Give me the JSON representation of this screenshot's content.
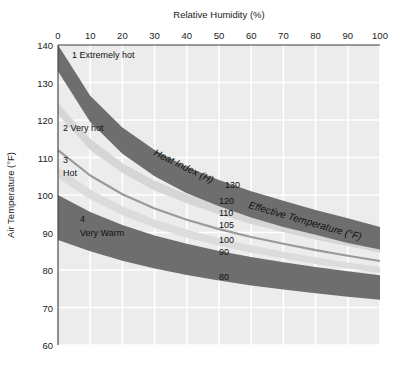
{
  "chart_data": {
    "type": "line",
    "title": "",
    "xlabel": "Relative Humidity (%)",
    "ylabel": "Air Temperature (°F)",
    "xlim": [
      0,
      100
    ],
    "ylim": [
      60,
      140
    ],
    "xticks": [
      "0",
      "10",
      "20",
      "30",
      "40",
      "50",
      "60",
      "70",
      "80",
      "90",
      "100"
    ],
    "yticks": [
      "140",
      "130",
      "120",
      "110",
      "100",
      "90",
      "80",
      "70",
      "60"
    ],
    "grid": true,
    "legend_position": "none",
    "annotations": {
      "heat_index": "Heat Index (H)",
      "effective_temperature": "Effective Temperature (°F)"
    },
    "x": [
      0,
      10,
      20,
      30,
      40,
      50,
      60,
      70,
      80,
      90,
      100
    ],
    "series": [
      {
        "name": "130",
        "label": "130",
        "style": "dark-band",
        "color": "#6e6e6e",
        "upper": [
          140.0,
          126.5,
          118.0,
          112.0,
          107.5,
          104.0,
          101.0,
          98.5,
          96.0,
          93.8,
          91.5
        ],
        "values": [
          136.5,
          123.0,
          114.5,
          108.5,
          104.0,
          100.5,
          97.5,
          95.0,
          92.7,
          90.5,
          88.5
        ],
        "lower": [
          133.0,
          119.5,
          111.0,
          105.0,
          100.5,
          97.0,
          94.0,
          91.5,
          89.4,
          87.2,
          85.5
        ]
      },
      {
        "name": "120",
        "label": "120",
        "style": "light-band",
        "color": "#d6d6d6",
        "upper": [
          124.5,
          115.0,
          108.5,
          103.8,
          100.2,
          97.2,
          94.7,
          92.5,
          90.5,
          88.6,
          86.8
        ],
        "values": [
          123.0,
          113.5,
          107.2,
          102.5,
          99.0,
          96.0,
          93.5,
          91.3,
          89.3,
          87.5,
          85.7
        ],
        "lower": [
          121.5,
          112.0,
          105.9,
          101.2,
          97.8,
          94.8,
          92.3,
          90.1,
          88.1,
          86.4,
          84.6
        ]
      },
      {
        "name": "110",
        "label": "110",
        "style": "mid-line",
        "color": "#9a9a9a",
        "values": [
          112.0,
          105.2,
          100.2,
          96.4,
          93.4,
          90.9,
          88.8,
          87.0,
          85.3,
          83.8,
          82.4
        ]
      },
      {
        "name": "105",
        "label": "105",
        "style": "light-band",
        "color": "#dcdcdc",
        "upper": [
          107.5,
          101.5,
          97.0,
          93.5,
          90.8,
          88.5,
          86.6,
          84.9,
          83.4,
          82.0,
          80.8
        ],
        "values": [
          106.0,
          100.2,
          95.8,
          92.4,
          89.7,
          87.5,
          85.6,
          84.0,
          82.5,
          81.2,
          80.0
        ],
        "lower": [
          104.5,
          98.9,
          94.6,
          91.3,
          88.6,
          86.5,
          84.6,
          83.1,
          81.6,
          80.4,
          79.2
        ]
      },
      {
        "name": "100",
        "label": "100",
        "style": "dark-band",
        "color": "#6e6e6e",
        "upper": [
          100.0,
          95.5,
          92.0,
          89.2,
          87.0,
          85.1,
          83.5,
          82.1,
          80.8,
          79.7,
          78.6
        ],
        "values": [
          94.0,
          90.2,
          87.2,
          84.8,
          82.8,
          81.1,
          79.7,
          78.4,
          77.3,
          76.3,
          75.4
        ],
        "lower": [
          88.0,
          85.0,
          82.5,
          80.4,
          78.7,
          77.2,
          75.9,
          74.8,
          73.8,
          72.9,
          72.1
        ]
      },
      {
        "name": "90",
        "label": "90",
        "style": "label-only",
        "color": "#6e6e6e",
        "values": [
          91.0,
          87.2,
          84.3,
          82.0,
          80.1,
          78.5,
          77.1,
          75.9,
          74.9,
          74.0,
          73.2
        ]
      },
      {
        "name": "80",
        "label": "80",
        "style": "label-only",
        "color": "#6e6e6e",
        "values": [
          85.0,
          81.5,
          78.8,
          76.7,
          75.0,
          73.5,
          72.3,
          71.2,
          70.3,
          69.5,
          68.8
        ]
      }
    ],
    "zones": [
      {
        "id": "1",
        "number": "1",
        "label": "Extremely hot",
        "text": "1 Extremely hot"
      },
      {
        "id": "2",
        "number": "2",
        "label": "Very hot",
        "text": "2 Very hot"
      },
      {
        "id": "3",
        "number": "3",
        "label": "Hot",
        "text": "3"
      },
      {
        "id": "3b",
        "number": "",
        "label": "Hot",
        "text": "Hot"
      },
      {
        "id": "4",
        "number": "4",
        "label": "Very Warm",
        "text": "4"
      },
      {
        "id": "4b",
        "number": "",
        "label": "Very Warm",
        "text": "Very Warm"
      }
    ],
    "curve_labels": [
      "130",
      "120",
      "110",
      "105",
      "100",
      "90",
      "80"
    ],
    "colors": {
      "plot_background": "#ececec",
      "gridline": "#ffffff",
      "dark_band": "#6e6e6e",
      "mid_band": "#9a9a9a",
      "light_band": "#d8d8d8",
      "axis": "#3a3a3a",
      "text": "#1a1a1a"
    }
  }
}
